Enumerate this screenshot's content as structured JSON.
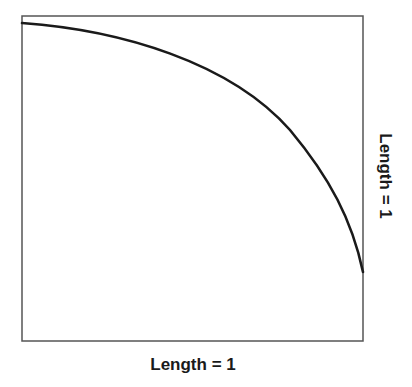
{
  "diagram": {
    "colors": {
      "box_stroke": "#555555",
      "curve_stroke": "#1a1a1a",
      "text": "#1a1a1a",
      "background": "#ffffff"
    },
    "box": {
      "x": 22,
      "y": 16,
      "width": 341,
      "height": 325
    },
    "curve": {
      "points": [
        [
          22,
          23
        ],
        [
          100,
          32
        ],
        [
          180,
          55
        ],
        [
          250,
          92
        ],
        [
          300,
          145
        ],
        [
          340,
          210
        ],
        [
          363,
          272
        ]
      ]
    },
    "labels": {
      "bottom": "Length = 1",
      "right": "Length = 1"
    }
  }
}
